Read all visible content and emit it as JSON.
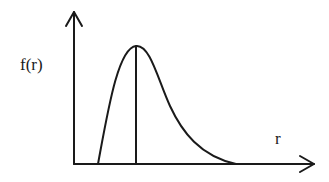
{
  "diagram": {
    "y_axis_label": "f(r)",
    "x_axis_label": "r",
    "curve": "skewed unimodal distribution with vertical line at peak (most probable r)",
    "stroke_color": "#1a1a1a",
    "background": "#ffffff"
  }
}
